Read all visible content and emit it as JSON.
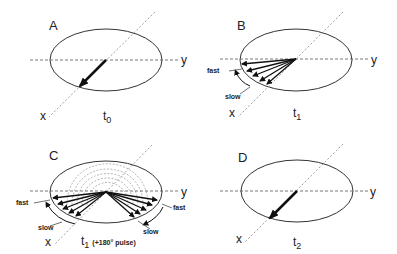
{
  "panels": [
    {
      "letter": "A",
      "time_label": "t",
      "time_sub": "0",
      "x_axis": "x",
      "y_axis": "y"
    },
    {
      "letter": "B",
      "time_label": "t",
      "time_sub": "1",
      "x_axis": "x",
      "y_axis": "y",
      "fast_label": "fast",
      "slow_label": "slow"
    },
    {
      "letter": "C",
      "time_label": "t",
      "time_sub": "1",
      "time_note": "(+180° pulse)",
      "x_axis": "x",
      "y_axis": "y",
      "fast_left": "fast",
      "slow_left": "slow",
      "fast_right": "fast",
      "slow_right": "slow"
    },
    {
      "letter": "D",
      "time_label": "t",
      "time_sub": "2",
      "x_axis": "x",
      "y_axis": "y"
    }
  ],
  "colors": {
    "line": "#333333",
    "dashed": "#777777",
    "background": "#ffffff"
  }
}
